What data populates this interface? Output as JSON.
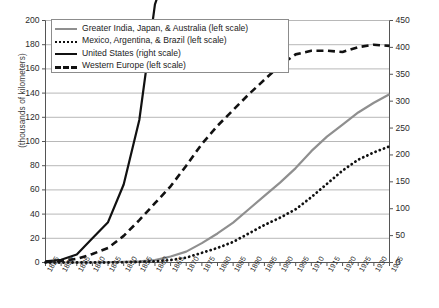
{
  "chart_data": {
    "type": "line",
    "title": "",
    "xlabel": "",
    "ylabel": "(thousands of kilometers)",
    "ylabel_right": "",
    "grid": true,
    "legend_position": "top-left",
    "xlim": [
      1825,
      1935
    ],
    "ylim": [
      0,
      200
    ],
    "ylim_right": [
      0,
      450
    ],
    "x": [
      1825,
      1830,
      1835,
      1840,
      1845,
      1850,
      1855,
      1860,
      1865,
      1870,
      1875,
      1880,
      1885,
      1890,
      1895,
      1900,
      1905,
      1910,
      1915,
      1920,
      1925,
      1930,
      1935
    ],
    "categories": [
      "1825",
      "1830",
      "1835",
      "1840",
      "1845",
      "1850",
      "1855",
      "1860",
      "1865",
      "1870",
      "1875",
      "1880",
      "1885",
      "1890",
      "1895",
      "1900",
      "1905",
      "1910",
      "1915",
      "1920",
      "1925",
      "1930",
      "1935"
    ],
    "yticks": [
      0,
      20,
      40,
      60,
      80,
      100,
      120,
      140,
      160,
      180,
      200
    ],
    "yticks_right": [
      0,
      50,
      100,
      150,
      200,
      250,
      300,
      350,
      400,
      450
    ],
    "series": [
      {
        "name": "Greater India, Japan, & Australia (left scale)",
        "scale": "left",
        "style": "solid",
        "color": "#8f8f8f",
        "values": [
          0,
          0,
          0,
          0,
          0.2,
          0.5,
          1,
          2,
          5,
          9,
          16,
          24,
          33,
          44,
          55,
          66,
          78,
          92,
          104,
          114,
          124,
          132,
          139
        ]
      },
      {
        "name": "Mexico, Argentina, & Brazil (left scale)",
        "scale": "left",
        "style": "dotted",
        "color": "#111111",
        "values": [
          0,
          0,
          0,
          0,
          0,
          0.2,
          0.5,
          1,
          2,
          4,
          8,
          12,
          17,
          24,
          31,
          37,
          44,
          54,
          65,
          76,
          85,
          91,
          96
        ]
      },
      {
        "name": "United States (right scale)",
        "scale": "right",
        "style": "solid",
        "color": "#111111",
        "values": [
          2,
          5,
          15,
          45,
          75,
          145,
          265,
          480,
          565,
          850,
          1200,
          1500,
          1900,
          2650,
          3000,
          3250,
          3750,
          3900,
          4080,
          4070,
          3960,
          3950,
          3900
        ]
      },
      {
        "name": "Western Europe (left scale)",
        "scale": "left",
        "style": "dashed",
        "color": "#111111",
        "values": [
          0.5,
          1.5,
          3,
          7,
          12,
          22,
          35,
          49,
          63,
          80,
          98,
          113,
          126,
          139,
          151,
          163,
          172,
          175,
          175,
          174,
          178,
          180,
          179
        ]
      }
    ]
  },
  "axes": {
    "left_title": "(thousands of kilometers)",
    "left_ticks": [
      "200",
      "180",
      "160",
      "140",
      "120",
      "100",
      "80",
      "60",
      "40",
      "20",
      "0"
    ],
    "right_ticks": [
      "450",
      "400",
      "350",
      "300",
      "250",
      "200",
      "150",
      "100",
      "50",
      "0"
    ],
    "x_ticks": [
      "1825",
      "1830",
      "1835",
      "1840",
      "1845",
      "1850",
      "1855",
      "1860",
      "1865",
      "1870",
      "1875",
      "1880",
      "1885",
      "1890",
      "1895",
      "1900",
      "1905",
      "1910",
      "1915",
      "1920",
      "1925",
      "1930",
      "1935"
    ]
  },
  "legend": {
    "items": [
      {
        "label": "Greater India, Japan, & Australia (left scale)",
        "swatch": "gray-solid-line-icon"
      },
      {
        "label": "Mexico, Argentina, & Brazil (left scale)",
        "swatch": "black-dotted-line-icon"
      },
      {
        "label": "United States (right scale)",
        "swatch": "black-solid-line-icon"
      },
      {
        "label": "Western Europe (left scale)",
        "swatch": "black-dashed-line-icon"
      }
    ]
  },
  "caption": {
    "text": ""
  },
  "colors": {
    "gray_series": "#8f8f8f",
    "black_series": "#111111",
    "grid": "#9a9a9a",
    "axis": "#555555"
  }
}
